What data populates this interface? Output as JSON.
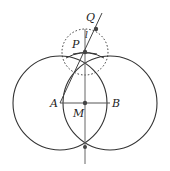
{
  "diagram": {
    "labels": {
      "A": "A",
      "B": "B",
      "M": "M",
      "P": "P",
      "Q": "Q",
      "l": "l"
    },
    "points": {
      "A": [
        60,
        103
      ],
      "B": [
        110,
        103
      ],
      "M": [
        85,
        103
      ],
      "P": [
        85,
        52
      ],
      "Q": [
        96,
        29
      ],
      "bottom_intersection": [
        85,
        147
      ]
    },
    "circles": [
      {
        "name": "circle-A",
        "center": "A",
        "radius": 47,
        "style": "solid"
      },
      {
        "name": "circle-B",
        "center": "B",
        "radius": 47,
        "style": "solid"
      },
      {
        "name": "circle-P",
        "center": "P",
        "radius": 23,
        "style": "dotted"
      }
    ],
    "colors": {
      "stroke": "#333333",
      "point": "#444444",
      "background": "#ffffff"
    }
  }
}
